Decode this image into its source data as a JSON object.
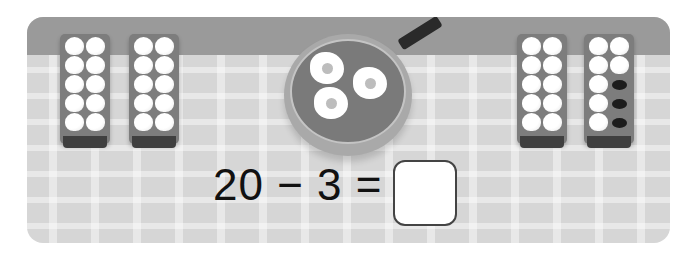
{
  "scene": {
    "description": "Egg trays on checkered tablecloth with frying pan",
    "trays": [
      {
        "id": "tray-1",
        "eggs": 10,
        "empty": 0
      },
      {
        "id": "tray-2",
        "eggs": 10,
        "empty": 0
      },
      {
        "id": "tray-3",
        "eggs": 10,
        "empty": 0
      },
      {
        "id": "tray-4",
        "eggs": 7,
        "empty": 3
      }
    ],
    "pan": {
      "fried_eggs": 3
    }
  },
  "problem": {
    "equation": "20 − 3 =",
    "answer": ""
  },
  "colors": {
    "wall": "#9a9a9a",
    "tablecloth": "#d6d6d6",
    "tray": "#7d7d7d",
    "pan_inner": "#7a7a7a"
  }
}
